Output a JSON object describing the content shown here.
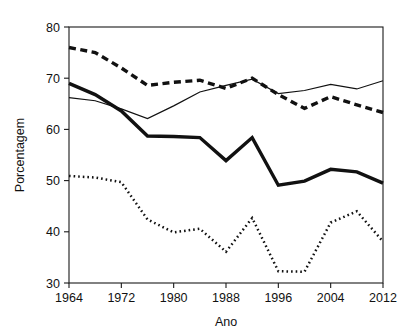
{
  "chart_data": {
    "type": "line",
    "title": "",
    "xlabel": "Ano",
    "ylabel": "Porcentagem",
    "xlim": [
      1964,
      2012
    ],
    "ylim": [
      30,
      80
    ],
    "grid": false,
    "legend": "none",
    "x": [
      1964,
      1968,
      1972,
      1976,
      1980,
      1984,
      1988,
      1992,
      1996,
      2000,
      2004,
      2008,
      2012
    ],
    "xticks": [
      1964,
      1972,
      1980,
      1988,
      1996,
      2004,
      2012
    ],
    "xtick_labels": [
      "1964",
      "1972",
      "1980",
      "1988",
      "1996",
      "2004",
      "2012"
    ],
    "yticks": [
      30,
      40,
      50,
      60,
      70,
      80
    ],
    "ytick_labels": [
      "30",
      "40",
      "50",
      "60",
      "70",
      "80"
    ],
    "series": [
      {
        "name": "series-thick-dashed",
        "style": "thick-dashed",
        "values": [
          76.0,
          75.0,
          72.0,
          68.6,
          69.2,
          69.6,
          68.0,
          70.0,
          66.8,
          64.1,
          66.4,
          64.8,
          63.3
        ]
      },
      {
        "name": "series-thin-solid",
        "style": "thin-solid",
        "values": [
          66.2,
          65.6,
          64.0,
          62.1,
          64.6,
          67.3,
          68.6,
          69.8,
          67.0,
          67.6,
          68.8,
          67.9,
          69.5
        ]
      },
      {
        "name": "series-thick-solid",
        "style": "thick-solid",
        "values": [
          69.0,
          66.8,
          63.6,
          58.7,
          58.6,
          58.4,
          53.9,
          58.4,
          49.1,
          49.9,
          52.2,
          51.7,
          49.5
        ]
      },
      {
        "name": "series-dotted",
        "style": "dotted",
        "values": [
          50.9,
          50.6,
          49.7,
          42.4,
          39.9,
          40.6,
          36.1,
          42.7,
          32.3,
          32.2,
          41.8,
          44.0,
          38.1
        ]
      }
    ]
  },
  "axis": {
    "x_title": "Ano",
    "y_title": "Porcentagem"
  }
}
